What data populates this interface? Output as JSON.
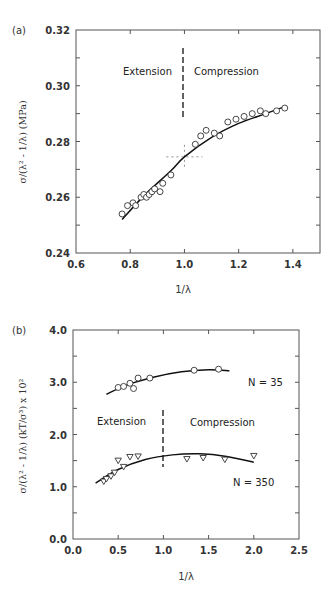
{
  "chart_data": [
    {
      "panel": "(a)",
      "type": "scatter",
      "xlabel": "1/λ",
      "ylabel": "σ/(λ² - 1/λ) (MPa)",
      "xlim": [
        0.6,
        1.5
      ],
      "ylim": [
        0.24,
        0.32
      ],
      "xticks": [
        "0.6",
        "0.8",
        "1.0",
        "1.2",
        "1.4"
      ],
      "yticks": [
        "0.24",
        "0.26",
        "0.28",
        "0.30",
        "0.32"
      ],
      "grid": false,
      "annotations": [
        "Extension",
        "Compression"
      ],
      "divider_x": 1.0,
      "crosshair": {
        "x": 1.0,
        "y": 0.2745
      },
      "series": [
        {
          "name": "data",
          "marker": "circle",
          "x": [
            0.77,
            0.79,
            0.81,
            0.82,
            0.84,
            0.85,
            0.86,
            0.87,
            0.88,
            0.89,
            0.91,
            0.92,
            0.95,
            1.04,
            1.06,
            1.08,
            1.11,
            1.13,
            1.16,
            1.19,
            1.22,
            1.25,
            1.28,
            1.3,
            1.34,
            1.37
          ],
          "y": [
            0.254,
            0.257,
            0.258,
            0.257,
            0.26,
            0.261,
            0.26,
            0.261,
            0.262,
            0.263,
            0.262,
            0.265,
            0.268,
            0.279,
            0.282,
            0.284,
            0.283,
            0.282,
            0.287,
            0.288,
            0.289,
            0.29,
            0.291,
            0.29,
            0.291,
            0.292
          ]
        },
        {
          "name": "fit",
          "marker": "line",
          "x": [
            0.77,
            0.85,
            0.95,
            1.0,
            1.1,
            1.2,
            1.3,
            1.37
          ],
          "y": [
            0.252,
            0.2605,
            0.2695,
            0.2745,
            0.2815,
            0.2865,
            0.29,
            0.2925
          ]
        }
      ]
    },
    {
      "panel": "(b)",
      "type": "scatter",
      "xlabel": "1/λ",
      "ylabel": "σ/(λ² - 1/λ) (kT/σ³) x 10²",
      "xlim": [
        0.0,
        2.5
      ],
      "ylim": [
        0.0,
        4.0
      ],
      "xticks": [
        "0.0",
        "0.5",
        "1.0",
        "1.5",
        "2.0",
        "2.5"
      ],
      "yticks": [
        "0.0",
        "1.0",
        "2.0",
        "3.0",
        "4.0"
      ],
      "grid": false,
      "annotations": [
        "Extension",
        "Compression",
        "N = 35",
        "N = 350"
      ],
      "divider_x": 1.0,
      "series": [
        {
          "name": "N = 35",
          "marker": "circle",
          "x": [
            0.5,
            0.56,
            0.63,
            0.67,
            0.72,
            0.85,
            1.34,
            1.61
          ],
          "y": [
            2.9,
            2.92,
            2.98,
            2.88,
            3.08,
            3.08,
            3.23,
            3.25
          ]
        },
        {
          "name": "N = 35 fit",
          "marker": "line",
          "x": [
            0.37,
            0.6,
            0.9,
            1.2,
            1.5,
            1.73
          ],
          "y": [
            2.77,
            2.95,
            3.1,
            3.2,
            3.24,
            3.22
          ]
        },
        {
          "name": "N = 350",
          "marker": "triangle-down",
          "x": [
            0.34,
            0.37,
            0.42,
            0.46,
            0.5,
            0.56,
            0.63,
            0.72,
            1.26,
            1.44,
            1.68,
            2.0
          ],
          "y": [
            1.1,
            1.15,
            1.2,
            1.27,
            1.5,
            1.38,
            1.57,
            1.58,
            1.53,
            1.55,
            1.52,
            1.59
          ]
        },
        {
          "name": "N = 350 fit",
          "marker": "line",
          "x": [
            0.25,
            0.5,
            0.8,
            1.1,
            1.4,
            1.7,
            2.0
          ],
          "y": [
            1.07,
            1.33,
            1.52,
            1.61,
            1.63,
            1.58,
            1.47
          ]
        }
      ]
    }
  ],
  "panels": {
    "a": {
      "label": "(a)",
      "xlabel": "1/λ",
      "ylabel": "σ/(λ² - 1/λ) (MPa)",
      "extension": "Extension",
      "compression": "Compression",
      "xticks": [
        "0.6",
        "0.8",
        "1.0",
        "1.2",
        "1.4"
      ],
      "yticks": [
        "0.24",
        "0.26",
        "0.28",
        "0.30",
        "0.32"
      ]
    },
    "b": {
      "label": "(b)",
      "xlabel": "1/λ",
      "ylabel": "σ/(λ² - 1/λ) (kT/σ³) x 10²",
      "extension": "Extension",
      "compression": "Compression",
      "n35": "N = 35",
      "n350": "N = 350",
      "xticks": [
        "0.0",
        "0.5",
        "1.0",
        "1.5",
        "2.0",
        "2.5"
      ],
      "yticks": [
        "0.0",
        "1.0",
        "2.0",
        "3.0",
        "4.0"
      ]
    }
  }
}
